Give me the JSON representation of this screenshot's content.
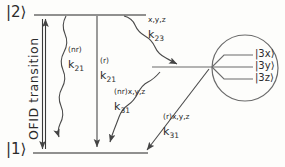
{
  "figure": {
    "title_vertical": "OFID transition",
    "levels": {
      "upper_label": "|2⟩",
      "lower_label": "|1⟩"
    },
    "sublevels": [
      {
        "label": "|3x⟩"
      },
      {
        "label": "|3y⟩"
      },
      {
        "label": "|3z⟩"
      }
    ],
    "rates": [
      {
        "id": "k21-nr",
        "symbol": "k",
        "superscript": "(nr)",
        "subscript": "21"
      },
      {
        "id": "k21-r",
        "symbol": "k",
        "superscript": "(r)",
        "subscript": "21"
      },
      {
        "id": "k23-xyz",
        "symbol": "k",
        "superscript": "x,y,z",
        "subscript": "23"
      },
      {
        "id": "k31-nr-xyz",
        "symbol": "k",
        "superscript": "(nr)x,y,z",
        "subscript": "31"
      },
      {
        "id": "k31-r-xyz",
        "symbol": "k",
        "superscript": "(r)x,y,z",
        "subscript": "31"
      }
    ],
    "colors": {
      "ink": "#2b2b2b",
      "line": "#555555",
      "background": "#fdfdfb"
    }
  }
}
